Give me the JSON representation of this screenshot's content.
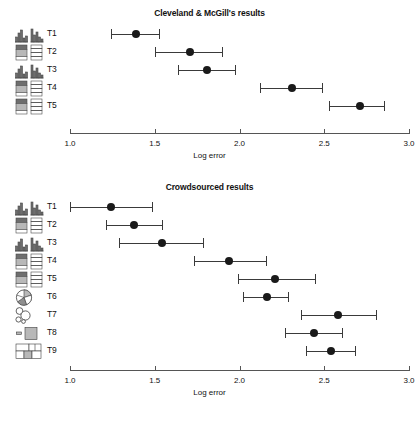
{
  "figure": {
    "background": "#ffffff",
    "accent_dot_color": "#1a1a1a",
    "line_color": "#3a3a3a",
    "axis_color": "#555555"
  },
  "panels": [
    {
      "id": "cleveland-mcgill",
      "title": "Cleveland & McGill's results",
      "axis": {
        "label": "Log error",
        "min": 1.0,
        "max": 3.0,
        "ticks": [
          1.0,
          1.5,
          2.0,
          2.5,
          3.0
        ],
        "ticklabels": [
          "1.0",
          "1.5",
          "2.0",
          "2.5",
          "3.0"
        ]
      },
      "rows": [
        {
          "label": "T1",
          "icon": "bar-chart-pair-icon",
          "mean": 1.39,
          "low": 1.24,
          "high": 1.53
        },
        {
          "label": "T2",
          "icon": "stacked-bar-pair-icon",
          "mean": 1.71,
          "low": 1.5,
          "high": 1.9
        },
        {
          "label": "T3",
          "icon": "bar-chart-pair-icon",
          "mean": 1.81,
          "low": 1.64,
          "high": 1.98
        },
        {
          "label": "T4",
          "icon": "stacked-bar-pair-icon",
          "mean": 2.31,
          "low": 2.12,
          "high": 2.49
        },
        {
          "label": "T5",
          "icon": "stacked-bar-pair-icon",
          "mean": 2.71,
          "low": 2.53,
          "high": 2.86
        }
      ]
    },
    {
      "id": "crowdsourced",
      "title": "Crowdsourced results",
      "axis": {
        "label": "Log error",
        "min": 1.0,
        "max": 3.0,
        "ticks": [
          1.0,
          1.5,
          2.0,
          2.5,
          3.0
        ],
        "ticklabels": [
          "1.0",
          "1.5",
          "2.0",
          "2.5",
          "3.0"
        ]
      },
      "rows": [
        {
          "label": "T1",
          "icon": "bar-chart-pair-icon",
          "mean": 1.24,
          "low": 1.0,
          "high": 1.49
        },
        {
          "label": "T2",
          "icon": "stacked-bar-pair-icon",
          "mean": 1.38,
          "low": 1.21,
          "high": 1.55
        },
        {
          "label": "T3",
          "icon": "bar-chart-pair-icon",
          "mean": 1.54,
          "low": 1.29,
          "high": 1.79
        },
        {
          "label": "T4",
          "icon": "stacked-bar-pair-icon",
          "mean": 1.94,
          "low": 1.73,
          "high": 2.16
        },
        {
          "label": "T5",
          "icon": "stacked-bar-pair-icon",
          "mean": 2.21,
          "low": 1.99,
          "high": 2.45
        },
        {
          "label": "T6",
          "icon": "pie-chart-icon",
          "mean": 2.16,
          "low": 2.02,
          "high": 2.29
        },
        {
          "label": "T7",
          "icon": "bubble-size-icon",
          "mean": 2.58,
          "low": 2.36,
          "high": 2.81
        },
        {
          "label": "T8",
          "icon": "rect-area-icon",
          "mean": 2.44,
          "low": 2.27,
          "high": 2.61
        },
        {
          "label": "T9",
          "icon": "treemap-icon",
          "mean": 2.54,
          "low": 2.39,
          "high": 2.69
        }
      ]
    }
  ],
  "chart_data": {
    "type": "scatter",
    "xlabel": "Log error",
    "ylabel": "",
    "xlim": [
      1.0,
      3.0
    ],
    "grid": false,
    "legend": "none",
    "panels": [
      {
        "title": "Cleveland & McGill's results",
        "xlabel": "Log error",
        "xlim": [
          1.0,
          3.0
        ],
        "xticks": [
          1.0,
          1.5,
          2.0,
          2.5,
          3.0
        ],
        "categories": [
          "T1",
          "T2",
          "T3",
          "T4",
          "T5"
        ],
        "values": [
          1.39,
          1.71,
          1.81,
          2.31,
          2.71
        ],
        "ci_low": [
          1.24,
          1.5,
          1.64,
          2.12,
          2.53
        ],
        "ci_high": [
          1.53,
          1.9,
          1.98,
          2.49,
          2.86
        ]
      },
      {
        "title": "Crowdsourced results",
        "xlabel": "Log error",
        "xlim": [
          1.0,
          3.0
        ],
        "xticks": [
          1.0,
          1.5,
          2.0,
          2.5,
          3.0
        ],
        "categories": [
          "T1",
          "T2",
          "T3",
          "T4",
          "T5",
          "T6",
          "T7",
          "T8",
          "T9"
        ],
        "values": [
          1.24,
          1.38,
          1.54,
          1.94,
          2.21,
          2.16,
          2.58,
          2.44,
          2.54
        ],
        "ci_low": [
          1.0,
          1.21,
          1.29,
          1.73,
          1.99,
          2.02,
          2.36,
          2.27,
          2.39
        ],
        "ci_high": [
          1.49,
          1.55,
          1.79,
          2.16,
          2.45,
          2.29,
          2.81,
          2.61,
          2.69
        ]
      }
    ]
  }
}
